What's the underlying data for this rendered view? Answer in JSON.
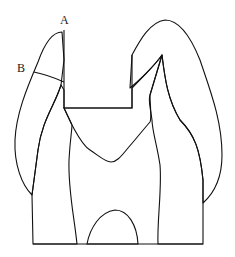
{
  "diagram": {
    "labels": [
      {
        "id": "A",
        "text": "A"
      },
      {
        "id": "B",
        "text": "B"
      }
    ],
    "regions": [
      {
        "name": "enamel",
        "hatching": "parallel-lines"
      },
      {
        "name": "dentin",
        "hatching": "radial-lines"
      },
      {
        "name": "cavity-preparation",
        "hatching": "none"
      },
      {
        "name": "pulp-chamber",
        "hatching": "none"
      }
    ],
    "colors": {
      "line": "#111111",
      "background": "#ffffff"
    }
  }
}
